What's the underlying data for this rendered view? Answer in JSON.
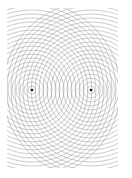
{
  "diagram": {
    "background": "#ffffff",
    "ring_color": "#9a9a9a",
    "ring_width": 0.6,
    "ring_spacing": 4,
    "ring_count": 22,
    "clip": {
      "x": 7,
      "y": 8,
      "width": 111,
      "height": 160
    },
    "sources": [
      {
        "id": "source-left",
        "x": 32,
        "y": 90,
        "color": "#111111"
      },
      {
        "id": "source-right",
        "x": 91,
        "y": 90,
        "color": "#111111"
      }
    ]
  }
}
